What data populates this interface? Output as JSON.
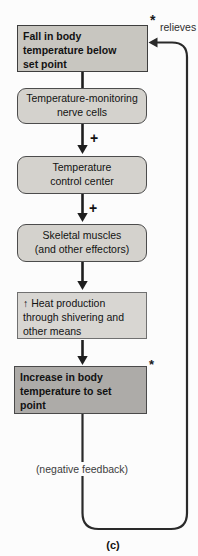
{
  "colors": {
    "background": "#fcfcfc",
    "stimulus_box_fill": "#c8c6c0",
    "rounded_box_fill": "#d4d2cd",
    "response_box_fill": "#d8d6d2",
    "result_box_fill": "#adaba8",
    "line_color": "#1e1e1e"
  },
  "flowchart": {
    "boxes": [
      {
        "id": "stimulus",
        "text": "Fall in body\ntemperature below\nset point"
      },
      {
        "id": "receptor",
        "text": "Temperature-monitoring\nnerve cells"
      },
      {
        "id": "control_center",
        "text": "Temperature\ncontrol center"
      },
      {
        "id": "effector",
        "text": "Skeletal muscles\n(and other effectors)"
      },
      {
        "id": "response",
        "text": "↑ Heat production\nthrough shivering and\nother means"
      },
      {
        "id": "result",
        "text": "Increase in body\ntemperature to set\npoint"
      }
    ],
    "plus_sign": "+",
    "asterisk": "*",
    "relieves_label": "relieves",
    "feedback_label": "(negative feedback)",
    "caption": "(c)"
  }
}
